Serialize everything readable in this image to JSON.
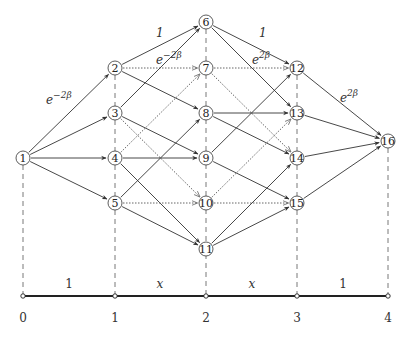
{
  "diagram": {
    "colors": {
      "stroke": "#333333",
      "dashed": "#555555",
      "dotted": "#666666",
      "axis": "#222222"
    },
    "columns_x": [
      23,
      115,
      206,
      297,
      388
    ],
    "nodes": [
      {
        "id": "1",
        "label": "1",
        "x": 23,
        "y": 158
      },
      {
        "id": "2",
        "label": "2",
        "x": 115,
        "y": 68
      },
      {
        "id": "3",
        "label": "3",
        "x": 115,
        "y": 113
      },
      {
        "id": "4",
        "label": "4",
        "x": 115,
        "y": 158
      },
      {
        "id": "5",
        "label": "5",
        "x": 115,
        "y": 203
      },
      {
        "id": "6",
        "label": "6",
        "x": 206,
        "y": 22
      },
      {
        "id": "7",
        "label": "7",
        "x": 206,
        "y": 68
      },
      {
        "id": "8",
        "label": "8",
        "x": 206,
        "y": 113
      },
      {
        "id": "9",
        "label": "9",
        "x": 206,
        "y": 158
      },
      {
        "id": "10",
        "label": "10",
        "x": 206,
        "y": 203
      },
      {
        "id": "11",
        "label": "11",
        "x": 206,
        "y": 249
      },
      {
        "id": "12",
        "label": "12",
        "x": 297,
        "y": 68
      },
      {
        "id": "13",
        "label": "13",
        "x": 297,
        "y": 113
      },
      {
        "id": "14",
        "label": "14",
        "x": 297,
        "y": 158
      },
      {
        "id": "15",
        "label": "15",
        "x": 297,
        "y": 203
      },
      {
        "id": "16",
        "label": "16",
        "x": 388,
        "y": 141
      }
    ],
    "edges": [
      {
        "from": "1",
        "to": "2",
        "style": "solid"
      },
      {
        "from": "1",
        "to": "3",
        "style": "solid"
      },
      {
        "from": "1",
        "to": "4",
        "style": "solid"
      },
      {
        "from": "1",
        "to": "5",
        "style": "solid"
      },
      {
        "from": "2",
        "to": "6",
        "style": "solid"
      },
      {
        "from": "2",
        "to": "7",
        "style": "dotted"
      },
      {
        "from": "2",
        "to": "8",
        "style": "solid"
      },
      {
        "from": "3",
        "to": "6",
        "style": "solid"
      },
      {
        "from": "3",
        "to": "9",
        "style": "solid"
      },
      {
        "from": "3",
        "to": "10",
        "style": "dotted"
      },
      {
        "from": "4",
        "to": "7",
        "style": "dotted"
      },
      {
        "from": "4",
        "to": "9",
        "style": "solid"
      },
      {
        "from": "4",
        "to": "11",
        "style": "solid"
      },
      {
        "from": "5",
        "to": "8",
        "style": "solid"
      },
      {
        "from": "5",
        "to": "10",
        "style": "dotted"
      },
      {
        "from": "5",
        "to": "11",
        "style": "solid"
      },
      {
        "from": "6",
        "to": "12",
        "style": "solid"
      },
      {
        "from": "6",
        "to": "13",
        "style": "solid"
      },
      {
        "from": "7",
        "to": "12",
        "style": "dotted"
      },
      {
        "from": "7",
        "to": "14",
        "style": "dotted"
      },
      {
        "from": "8",
        "to": "13",
        "style": "solid"
      },
      {
        "from": "8",
        "to": "14",
        "style": "solid"
      },
      {
        "from": "9",
        "to": "12",
        "style": "solid"
      },
      {
        "from": "9",
        "to": "15",
        "style": "solid"
      },
      {
        "from": "10",
        "to": "13",
        "style": "dotted"
      },
      {
        "from": "10",
        "to": "15",
        "style": "dotted"
      },
      {
        "from": "11",
        "to": "14",
        "style": "solid"
      },
      {
        "from": "11",
        "to": "15",
        "style": "solid"
      },
      {
        "from": "12",
        "to": "16",
        "style": "solid"
      },
      {
        "from": "13",
        "to": "16",
        "style": "solid"
      },
      {
        "from": "14",
        "to": "16",
        "style": "solid"
      },
      {
        "from": "15",
        "to": "16",
        "style": "solid"
      }
    ],
    "edge_labels": [
      {
        "text": "e",
        "sup": "−2β",
        "x": 46,
        "y": 104
      },
      {
        "text": "1",
        "sup": "",
        "x": 156,
        "y": 37
      },
      {
        "text": "e",
        "sup": "−2β",
        "x": 156,
        "y": 64
      },
      {
        "text": "1",
        "sup": "",
        "x": 259,
        "y": 37
      },
      {
        "text": "e",
        "sup": "2β",
        "x": 252,
        "y": 64
      },
      {
        "text": "e",
        "sup": "2β",
        "x": 340,
        "y": 102
      }
    ],
    "axis": {
      "y": 296,
      "ticks": [
        {
          "x": 23,
          "label": "0"
        },
        {
          "x": 115,
          "label": "1"
        },
        {
          "x": 206,
          "label": "2"
        },
        {
          "x": 297,
          "label": "3"
        },
        {
          "x": 388,
          "label": "4"
        }
      ],
      "segment_labels": [
        {
          "x": 69,
          "label": "1",
          "italic": false
        },
        {
          "x": 160,
          "label": "x",
          "italic": true
        },
        {
          "x": 252,
          "label": "x",
          "italic": true
        },
        {
          "x": 343,
          "label": "1",
          "italic": false
        }
      ]
    }
  }
}
